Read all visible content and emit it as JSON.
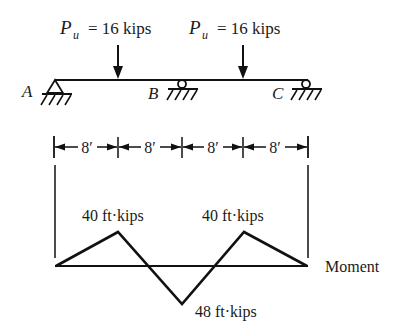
{
  "diagram": {
    "type": "continuous-beam-moment-diagram",
    "loads": [
      {
        "symbol": "P",
        "subscript": "u",
        "eq": "= 16 kips",
        "x_ft": 8
      },
      {
        "symbol": "P",
        "subscript": "u",
        "eq": "= 16 kips",
        "x_ft": 24
      }
    ],
    "supports": [
      {
        "label": "A",
        "kind": "pin",
        "x_ft": 0
      },
      {
        "label": "B",
        "kind": "roller",
        "x_ft": 16
      },
      {
        "label": "C",
        "kind": "roller",
        "x_ft": 32
      }
    ],
    "dimensions": [
      "8′",
      "8′",
      "8′",
      "8′"
    ],
    "moment": {
      "label": "Moment",
      "points": [
        {
          "x_ft": 0,
          "value": 0
        },
        {
          "x_ft": 8,
          "value": 40,
          "label": "40 ft·kips"
        },
        {
          "x_ft": 16,
          "value": -48,
          "label": "48 ft·kips"
        },
        {
          "x_ft": 24,
          "value": 40,
          "label": "40 ft·kips"
        },
        {
          "x_ft": 32,
          "value": 0
        }
      ]
    }
  }
}
